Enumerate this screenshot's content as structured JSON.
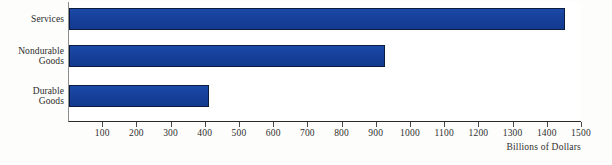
{
  "chart_data": {
    "type": "bar",
    "orientation": "horizontal",
    "title": "",
    "xlabel": "Billions of Dollars",
    "ylabel": "",
    "categories": [
      "Services",
      "Nondurable Goods",
      "Durable Goods"
    ],
    "category_lines": [
      [
        "Services"
      ],
      [
        "Nondurable",
        "Goods"
      ],
      [
        "Durable",
        "Goods"
      ]
    ],
    "values": [
      1450,
      925,
      410
    ],
    "xlim": [
      0,
      1500
    ],
    "xticks": [
      100,
      200,
      300,
      400,
      500,
      600,
      700,
      800,
      900,
      1000,
      1100,
      1200,
      1300,
      1400,
      1500
    ],
    "xtick_labels": [
      "100",
      "200",
      "300",
      "400",
      "500",
      "600",
      "700",
      "800",
      "900",
      "1000",
      "1100",
      "1200",
      "1300",
      "1400",
      "1500"
    ],
    "grid": false,
    "legend": null,
    "series": [
      {
        "name": "Consumption Expenditures",
        "values": [
          1450,
          925,
          410
        ]
      }
    ],
    "colors": {
      "bar": "#17409b",
      "bar_border": "#0c1c3f",
      "axis": "#2a2a2a",
      "text": "#2f2f2f",
      "plot_background": "#ffffff",
      "page_background": "#fdfdfb"
    }
  }
}
